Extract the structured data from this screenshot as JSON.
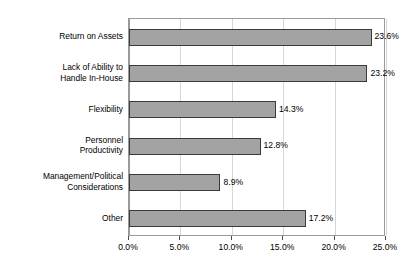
{
  "chart_data": {
    "type": "bar",
    "orientation": "horizontal",
    "title": "",
    "subtitle": "",
    "xlabel": "",
    "ylabel": "",
    "categories": [
      "Return on Assets",
      "Lack of Ability to\nHandle In-House",
      "Flexibility",
      "Personnel\nProductivity",
      "Management/Political\nConsiderations",
      "Other"
    ],
    "values": [
      23.6,
      23.2,
      14.3,
      12.8,
      8.9,
      17.2
    ],
    "value_labels": [
      "23.6%",
      "23.2%",
      "14.3%",
      "12.8%",
      "8.9%",
      "17.2%"
    ],
    "xlim": [
      0,
      25
    ],
    "xticks": [
      0,
      5,
      10,
      15,
      20,
      25
    ],
    "xtick_labels": [
      "0.0%",
      "5.0%",
      "10.0%",
      "15.0%",
      "20.0%",
      "25.0%"
    ],
    "grid": true,
    "grid_axis": "x",
    "legend": false,
    "bar_color": "#a3a3a3",
    "bar_border_color": "#3a3a3a",
    "gridline_color": "#d6d6d6",
    "plot_border_color": "#9a9a9a",
    "text_color": "#000000",
    "background_color": "#ffffff"
  }
}
